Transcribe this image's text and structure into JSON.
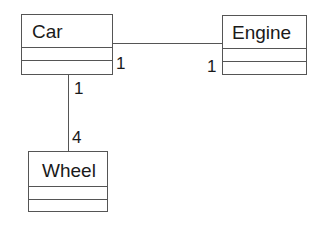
{
  "diagram": {
    "type": "uml-class-diagram",
    "classes": [
      {
        "name": "Car"
      },
      {
        "name": "Engine"
      },
      {
        "name": "Wheel"
      }
    ],
    "associations": [
      {
        "from": "Car",
        "to": "Engine",
        "from_multiplicity": "1",
        "to_multiplicity": "1"
      },
      {
        "from": "Car",
        "to": "Wheel",
        "from_multiplicity": "1",
        "to_multiplicity": "4"
      }
    ]
  }
}
